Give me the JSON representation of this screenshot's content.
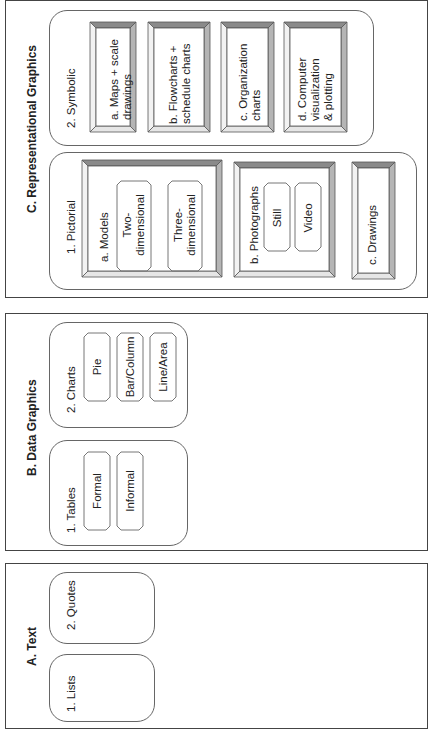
{
  "diagram": {
    "orientation": "rotated 90deg counter-clockwise",
    "sections": {
      "A": {
        "title": "A. Text",
        "groups": [
          {
            "label": "1. Lists"
          },
          {
            "label": "2. Quotes"
          }
        ]
      },
      "B": {
        "title": "B. Data Graphics",
        "groups": [
          {
            "label": "1. Tables",
            "items": [
              "Formal",
              "Informal"
            ]
          },
          {
            "label": "2. Charts",
            "items": [
              "Pie",
              "Bar/Column",
              "Line/Area"
            ]
          }
        ]
      },
      "C": {
        "title": "C. Representational Graphics",
        "pictorial": {
          "label": "1. Pictorial",
          "models": {
            "label": "a. Models",
            "items": [
              "Two-\ndimensional",
              "Three-\ndimensional"
            ]
          },
          "photographs": {
            "label": "b. Photographs",
            "items": [
              "Still",
              "Video"
            ]
          },
          "drawings": {
            "label": "c. Drawings"
          }
        },
        "symbolic": {
          "label": "2. Symbolic",
          "items": [
            "a. Maps + scale\ndrawings",
            "b. Flowcharts +\nschedule charts",
            "c. Organization\ncharts",
            "d. Computer\nvisualization\n& plotting"
          ]
        }
      }
    },
    "colors": {
      "border": "#444444",
      "bevel_dark": "#8a8a8a",
      "bevel_mid": "#b5b5b5",
      "bevel_light": "#e6e6e6"
    }
  }
}
